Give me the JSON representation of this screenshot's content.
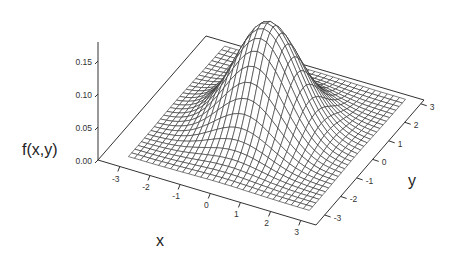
{
  "chart_data": {
    "type": "surface3d",
    "title": "",
    "function": "bivariate standard normal density f(x,y) = exp(-(x^2+y^2)/2) / (2*pi)",
    "xlabel": "x",
    "ylabel": "y",
    "zlabel": "f(x,y)",
    "xlim": [
      -3,
      3
    ],
    "ylim": [
      -3,
      3
    ],
    "zlim": [
      0,
      0.17
    ],
    "x_ticks": [
      "-3",
      "-2",
      "-1",
      "0",
      "1",
      "2",
      "3"
    ],
    "y_ticks": [
      "-3",
      "-2",
      "-1",
      "0",
      "1",
      "2",
      "3"
    ],
    "z_ticks": [
      "0.00",
      "0.05",
      "0.10",
      "0.15"
    ],
    "peak": {
      "x": 0,
      "y": 0,
      "z": 0.159
    },
    "grid_resolution": 31,
    "sample_points": [
      {
        "x": 0,
        "y": 0,
        "z": 0.159
      },
      {
        "x": 1,
        "y": 0,
        "z": 0.097
      },
      {
        "x": 0,
        "y": 1,
        "z": 0.097
      },
      {
        "x": 1,
        "y": 1,
        "z": 0.059
      },
      {
        "x": 2,
        "y": 0,
        "z": 0.022
      },
      {
        "x": 2,
        "y": 2,
        "z": 0.003
      },
      {
        "x": 3,
        "y": 0,
        "z": 0.002
      },
      {
        "x": 3,
        "y": 3,
        "z": 0.0
      }
    ],
    "grid": false,
    "legend": null
  },
  "colors": {
    "background": "#ffffff",
    "mesh_line": "#2a2a2a",
    "mesh_fill": "#ffffff",
    "floor_line": "#333333",
    "text": "#222222"
  }
}
